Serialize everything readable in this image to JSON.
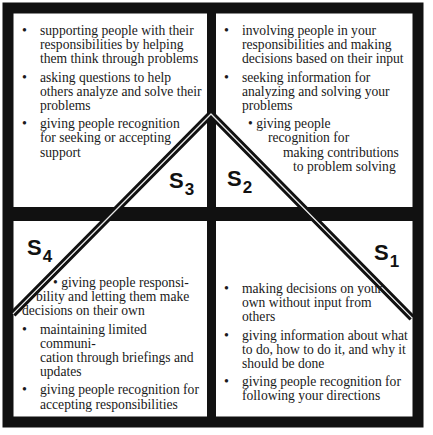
{
  "diagram": {
    "type": "situational-leadership-quadrants",
    "colors": {
      "frame": "#111111",
      "background": "#ffffff",
      "text": "#1a1a1a"
    },
    "quadrants": {
      "top_left": {
        "style_label": "S",
        "style_number": "3",
        "items": [
          "supporting people with their responsibilities by helping them think through problems",
          "asking questions to help others analyze and solve their problems",
          "giving people recognition for seeking or accepting support"
        ],
        "item_lines": [
          [
            "supporting people with their",
            "responsibilities by helping",
            "them think through problems"
          ],
          [
            "asking questions to help",
            "others analyze and solve their",
            "problems"
          ],
          [
            "giving people recognition",
            "for seeking or accepting",
            "support"
          ]
        ]
      },
      "top_right": {
        "style_label": "S",
        "style_number": "2",
        "items": [
          "involving people in your responsibilities and making decisions based on their input",
          "seeking information for analyzing and solving your problems",
          "giving people recognition for making contributions to problem solving"
        ],
        "item_lines": [
          [
            "involving people in your",
            "responsibilities and making",
            "decisions based on their input"
          ],
          [
            "seeking information for",
            "analyzing and solving your",
            "problems"
          ],
          [
            "• giving people",
            "recognition for",
            "making contributions",
            "to problem solving"
          ]
        ]
      },
      "bottom_left": {
        "style_label": "S",
        "style_number": "4",
        "items": [
          "giving people responsibility and letting them make decisions on their own",
          "maintaining limited communication through briefings and updates",
          "giving people recognition for accepting responsibilities"
        ],
        "item_lines": [
          [
            "• giving people responsi-",
            "bility and letting them make",
            "decisions on their own"
          ],
          [
            "maintaining limited communi-",
            "cation through briefings and",
            "updates"
          ],
          [
            "giving people recognition for",
            "accepting responsibilities"
          ]
        ]
      },
      "bottom_right": {
        "style_label": "S",
        "style_number": "1",
        "items": [
          "making decisions on your own without input from others",
          "giving information about what to do, how to do it, and why it should be done",
          "giving people recognition for following your directions"
        ],
        "item_lines": [
          [
            "making decisions on your",
            "own without input from",
            "others"
          ],
          [
            "giving information about what",
            "to do, how to do it, and why it",
            "should be done"
          ],
          [
            "giving people recognition for",
            "following your directions"
          ]
        ]
      }
    }
  }
}
